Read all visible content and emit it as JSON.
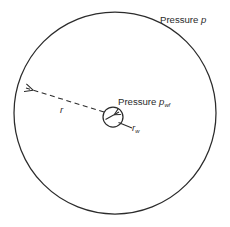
{
  "figure": {
    "width": 230,
    "height": 227,
    "background_color": "#ffffff",
    "line_color": "#2b2b2b",
    "text_color": "#2b2b2b"
  },
  "labels": {
    "outer_pressure": {
      "prefix": "Pressure",
      "symbol": "p",
      "subscript": ""
    },
    "wellbore_pressure": {
      "prefix": "Pressure",
      "symbol": "p",
      "subscript": "wf"
    },
    "drainage_radius": {
      "symbol": "r",
      "subscript": ""
    },
    "wellbore_radius": {
      "symbol": "r",
      "subscript": "w"
    }
  },
  "shapes": {
    "drainage_circle": {
      "name": "drainage-boundary-circle",
      "cx": 115,
      "cy": 113,
      "r": 101,
      "stroke": "#2b2b2b",
      "stroke_width": 1.2,
      "fill": "none",
      "style": "solid"
    },
    "wellbore_circle": {
      "name": "wellbore-circle",
      "cx": 113,
      "cy": 117,
      "r": 10,
      "stroke": "#2b2b2b",
      "stroke_width": 1.2,
      "fill": "none",
      "style": "solid"
    },
    "radius_arrow": {
      "name": "drainage-radius-arrow",
      "x1": 104,
      "y1": 112,
      "x2": 22,
      "y2": 86,
      "style": "dashed",
      "dash_pattern": "5,3.5",
      "arrowhead": "end"
    },
    "wellbore_radius_leader": {
      "name": "wellbore-radius-leader-line",
      "x1": 119,
      "y1": 122,
      "x2": 132,
      "y2": 128,
      "style": "solid"
    },
    "flow_arrow": {
      "name": "flow-direction-arrow",
      "x1": 106,
      "y1": 119,
      "x2": 119,
      "y2": 112,
      "style": "solid",
      "arrowhead": "end"
    }
  }
}
